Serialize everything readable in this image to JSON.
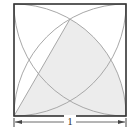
{
  "diagram": {
    "type": "geometry",
    "square": {
      "side_label": "1"
    },
    "arcs": [
      {
        "center": "bottom-left",
        "radius": "1"
      },
      {
        "center": "bottom-right",
        "radius": "1"
      },
      {
        "center": "top-left",
        "radius": "1"
      },
      {
        "center": "top-right",
        "radius": "1"
      }
    ],
    "shaded_region": {
      "shape": "sector",
      "center": "bottom-left",
      "angle_degrees": 60
    },
    "dimension": {
      "label": "1",
      "orientation": "horizontal",
      "position": "below square"
    },
    "colors": {
      "border": "#333333",
      "arc": "#a8a8a8",
      "shade": "#ececec",
      "dimension": "#444444"
    }
  }
}
